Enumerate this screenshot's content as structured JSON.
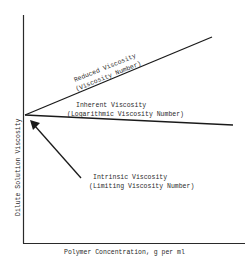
{
  "diagram": {
    "type": "line-schematic",
    "y_axis_label": "Dilute Solution Viscosity",
    "x_axis_label": "Polymer Concentration, g per ml",
    "lines": [
      {
        "name": "reduced",
        "label_line1": "Reduced Viscosity",
        "label_line2": "(Viscosity Number)",
        "trend": "increasing"
      },
      {
        "name": "inherent",
        "label_line1": "Inherent Viscosity",
        "label_line2": "(Logarithmic Viscosity Number)",
        "trend": "slightly decreasing"
      }
    ],
    "arrow_annotation": {
      "label_line1": "Intrinsic Viscosity",
      "label_line2": "(Limiting Viscosity Number)",
      "points_to": "common intercept at zero concentration"
    },
    "colors": {
      "ink": "#1a1a1a",
      "background": "#ffffff"
    }
  }
}
